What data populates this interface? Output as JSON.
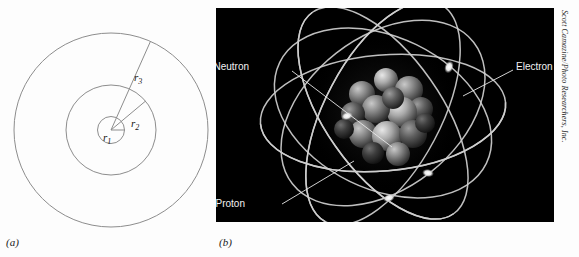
{
  "figure": {
    "panel_a": {
      "caption": "(a)",
      "labels": [
        {
          "base": "r",
          "sub": "1"
        },
        {
          "base": "r",
          "sub": "2"
        },
        {
          "base": "r",
          "sub": "3"
        }
      ],
      "stroke_color": "#8d8d8d",
      "background_color": "#fdfdfd"
    },
    "panel_b": {
      "caption": "(b)",
      "background_color": "#000000",
      "orbit_color": "#cfcfcf",
      "nucleus_colors": [
        "#b9b9b9",
        "#8e8e8e",
        "#6d6d6d",
        "#4a4a4a"
      ],
      "callouts": [
        {
          "label": "Neutron"
        },
        {
          "label": "Electron"
        },
        {
          "label": "Proton"
        }
      ]
    },
    "credit": "Scott Camazine/Photo Researchers, Inc."
  }
}
